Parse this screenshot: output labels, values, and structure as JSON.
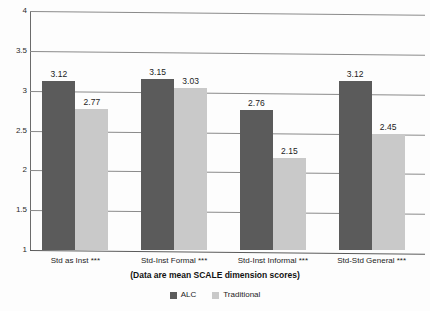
{
  "chart_data": {
    "type": "bar",
    "title": "",
    "subtitle": "(Data are mean SCALE dimension scores)",
    "xlabel": "",
    "ylabel": "",
    "ylim": [
      1,
      4
    ],
    "ytick_labels": [
      "4",
      "3.5",
      "3",
      "2.5",
      "2",
      "1.5",
      "1"
    ],
    "ytick_values": [
      4,
      3.5,
      3,
      2.5,
      2,
      1.5,
      1
    ],
    "grid": true,
    "legend_position": "bottom",
    "categories": [
      "Std as Inst ***",
      "Std-Inst Formal ***",
      "Std-Inst Informal ***",
      "Std-Std General ***"
    ],
    "series": [
      {
        "name": "ALC",
        "color": "#5b5b5b",
        "values": [
          3.12,
          3.15,
          2.76,
          3.12
        ],
        "labels": [
          "3.12",
          "3.15",
          "2.76",
          "3.12"
        ]
      },
      {
        "name": "Traditional",
        "color": "#c9c9c9",
        "values": [
          2.77,
          3.03,
          2.15,
          2.45
        ],
        "labels": [
          "2.77",
          "3.03",
          "2.15",
          "2.45"
        ]
      }
    ]
  },
  "legend": {
    "items": [
      {
        "label": "ALC",
        "swatch": "alc"
      },
      {
        "label": "Traditional",
        "swatch": "traditional"
      }
    ]
  }
}
